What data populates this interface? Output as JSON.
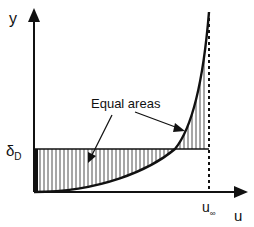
{
  "diagram": {
    "y_axis_label": "y",
    "x_axis_label": "u",
    "delta_label": "δ",
    "delta_sub": "D",
    "u_inf_label": "u",
    "u_inf_sub": "∞",
    "annotation": "Equal areas"
  }
}
